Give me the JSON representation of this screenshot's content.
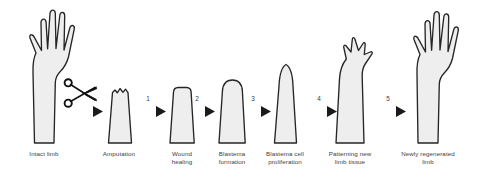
{
  "figure": {
    "background_color": "#ffffff",
    "limb_fill_color": "#eeeeee",
    "limb_outline_color": "#262626",
    "arrow_color": "#1a1a1a",
    "label_color": "#3d3d3d"
  },
  "stages": [
    {
      "id": "intact-limb",
      "label": "Intact limb",
      "icon": "hand-limb-icon",
      "label_x": 18,
      "label_y": 150,
      "label_width": 70
    },
    {
      "id": "amputation",
      "label": "Amputation",
      "icon": "amputated-stump-icon",
      "label_x": 89,
      "label_y": 150,
      "label_width": 66
    },
    {
      "id": "wound-healing",
      "label": "Wound\nhealing",
      "icon": "flat-top-stump-icon",
      "label_x": 155,
      "label_y": 150,
      "label_width": 58
    },
    {
      "id": "blastema-formation",
      "label": "Blastema\nformation",
      "icon": "domed-blastema-icon",
      "label_x": 205,
      "label_y": 150,
      "label_width": 62
    },
    {
      "id": "blastema-cell-proliferation",
      "label": "Blastema cell\nproliferation",
      "icon": "elongated-blastema-icon",
      "label_x": 255,
      "label_y": 150,
      "label_width": 72
    },
    {
      "id": "patterning-new-limb-tissue",
      "label": "Patterning new\nlimb tissue",
      "icon": "digit-bud-limb-icon",
      "label_x": 319,
      "label_y": 150,
      "label_width": 78
    },
    {
      "id": "newly-regenerated-limb",
      "label": "Newly regenerated\nlimb",
      "icon": "regenerated-hand-icon",
      "label_x": 392,
      "label_y": 150,
      "label_width": 92
    }
  ],
  "arrows": [
    {
      "id": "arrow-amputation",
      "number": "",
      "x": 93,
      "y": 111,
      "number_x": 0,
      "number_y": 0
    },
    {
      "id": "arrow-1",
      "number": "1",
      "x": 156,
      "y": 111,
      "number_x": 145,
      "number_y": 98
    },
    {
      "id": "arrow-2",
      "number": "2",
      "x": 205,
      "y": 111,
      "number_x": 194,
      "number_y": 98
    },
    {
      "id": "arrow-3",
      "number": "3",
      "x": 261,
      "y": 111,
      "number_x": 250,
      "number_y": 98
    },
    {
      "id": "arrow-4",
      "number": "4",
      "x": 327,
      "y": 111,
      "number_x": 316,
      "number_y": 98
    },
    {
      "id": "arrow-5",
      "number": "5",
      "x": 396,
      "y": 111,
      "number_x": 385,
      "number_y": 98
    }
  ],
  "tools": [
    {
      "id": "scissors",
      "label": "scissors-icon",
      "x": 63,
      "y": 78
    }
  ]
}
